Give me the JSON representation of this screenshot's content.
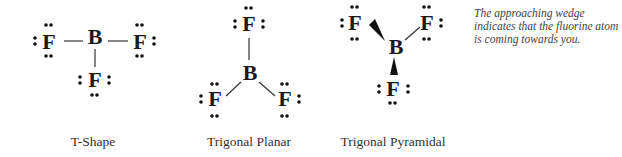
{
  "figure": {
    "structures": [
      {
        "name": "T-Shape",
        "central_atom": "B",
        "ligand": "F",
        "ligand_count": 3
      },
      {
        "name": "Trigonal Planar",
        "central_atom": "B",
        "ligand": "F",
        "ligand_count": 3
      },
      {
        "name": "Trigonal Pyramidal",
        "central_atom": "B",
        "ligand": "F",
        "ligand_count": 3
      }
    ],
    "atoms": {
      "boron": "B",
      "fluorine": "F"
    },
    "note": "The approaching wedge indicates that the fluorine atom is coming towards you.",
    "colors": {
      "text": "#1a1a1a",
      "bond": "#333333",
      "background": "#ffffff"
    }
  }
}
